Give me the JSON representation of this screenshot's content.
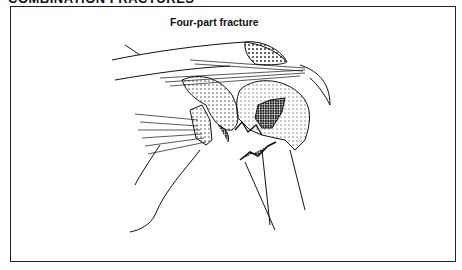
{
  "page": {
    "section_header": "COMBINATION FRACTURES"
  },
  "figure": {
    "caption": "Four-part fracture"
  }
}
